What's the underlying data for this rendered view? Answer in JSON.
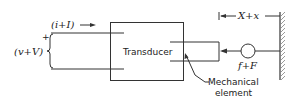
{
  "diagram": {
    "type": "transducer-schematic",
    "labels": {
      "current": "(i+I)",
      "voltage": "(v+V)",
      "plus_sign": "+",
      "transducer": "Transducer",
      "displacement": "X+x",
      "force": "f+F",
      "mechanical_element_line1": "Mechanical",
      "mechanical_element_line2": "element"
    }
  }
}
